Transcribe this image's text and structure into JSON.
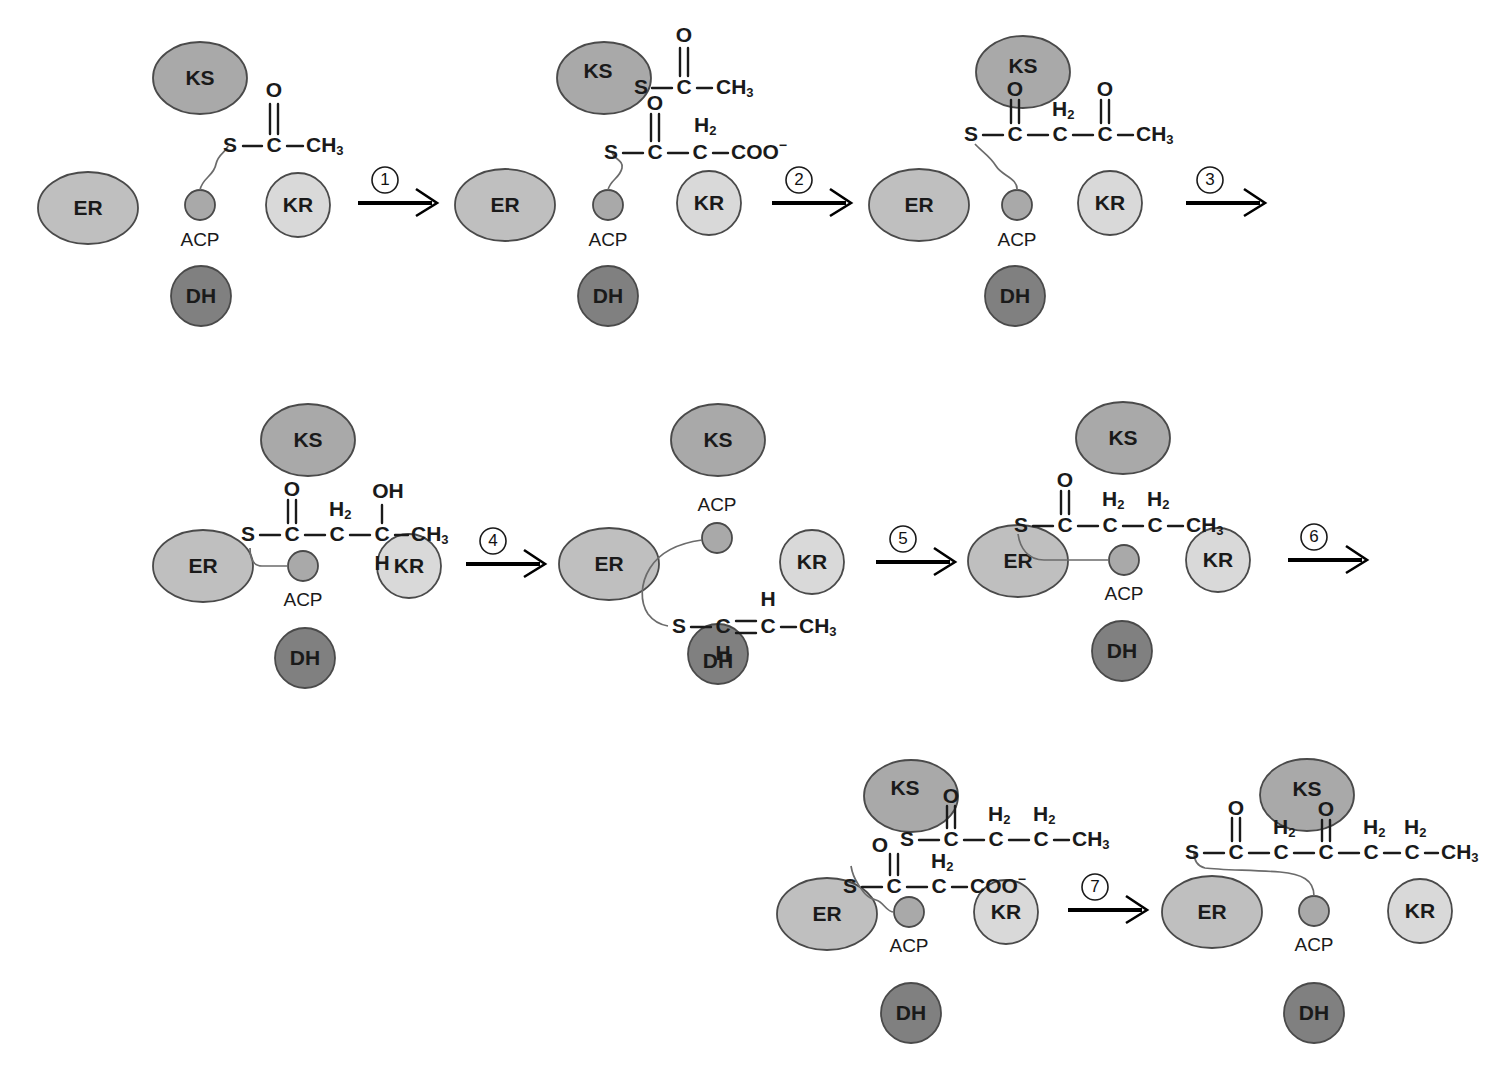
{
  "figure": {
    "type": "reaction-scheme-diagram",
    "panel_count": 8,
    "step_count": 7
  },
  "colors": {
    "background": "#ffffff",
    "ks_fill": "#a9a9a9",
    "er_fill": "#bfbfbf",
    "kr_fill": "#d9d9d9",
    "dh_fill": "#808080",
    "acp_fill": "#a9a9a9",
    "outline": "#4a4a4a",
    "text": "#1a1a1a",
    "arrow": "#000000"
  },
  "domains": {
    "ks": "KS",
    "er": "ER",
    "kr": "KR",
    "dh": "DH",
    "acp": "ACP"
  },
  "atoms": {
    "S": "S",
    "C": "C",
    "O": "O",
    "H": "H",
    "CH3": "CH",
    "CH3_sub": "3",
    "H2_main": "H",
    "H2_sub": "2",
    "OH": "OH",
    "COO": "COO",
    "COO_sup": "−"
  },
  "steps": [
    {
      "id": 1,
      "label": "1"
    },
    {
      "id": 2,
      "label": "2"
    },
    {
      "id": 3,
      "label": "3"
    },
    {
      "id": 4,
      "label": "4"
    },
    {
      "id": 5,
      "label": "5"
    },
    {
      "id": 6,
      "label": "6"
    },
    {
      "id": 7,
      "label": "7"
    }
  ],
  "panels": [
    {
      "index": 1,
      "name": "acetyl-acp",
      "row": 1,
      "molecule": "S-C(=O)-CH3 on ACP",
      "chain_labels": [
        "S",
        "C",
        "CH3"
      ],
      "substituents": [
        "O (double bond on C)"
      ],
      "domains_shown": [
        "KS",
        "ER",
        "KR",
        "DH",
        "ACP"
      ]
    },
    {
      "index": 2,
      "name": "acetyl-ks-malonyl-acp",
      "row": 1,
      "molecule": "KS-S-C(=O)-CH3 and ACP-S-C(=O)-CH2-COO-",
      "chain_labels": [
        "S",
        "C",
        "CH3",
        "S",
        "C",
        "C",
        "COO"
      ],
      "substituents": [
        "O",
        "O",
        "H2"
      ],
      "domains_shown": [
        "KS",
        "ER",
        "KR",
        "DH",
        "ACP"
      ]
    },
    {
      "index": 3,
      "name": "acetoacetyl-acp",
      "row": 1,
      "molecule": "S-C(=O)-CH2-C(=O)-CH3 on ACP",
      "chain_labels": [
        "S",
        "C",
        "C",
        "C",
        "CH3"
      ],
      "substituents": [
        "O",
        "H2",
        "O"
      ],
      "domains_shown": [
        "KS",
        "ER",
        "KR",
        "DH",
        "ACP"
      ]
    },
    {
      "index": 4,
      "name": "hydroxybutyryl-acp",
      "row": 2,
      "molecule": "S-C(=O)-CH2-CH(OH)-CH3 on ACP",
      "chain_labels": [
        "S",
        "C",
        "C",
        "C",
        "CH3"
      ],
      "substituents": [
        "O",
        "H2",
        "OH",
        "H"
      ],
      "domains_shown": [
        "KS",
        "ER",
        "KR",
        "DH",
        "ACP"
      ]
    },
    {
      "index": 5,
      "name": "crotonyl-acp",
      "row": 2,
      "molecule": "S-CH=CH-CH3 on ACP",
      "chain_labels": [
        "S",
        "C",
        "C",
        "CH3"
      ],
      "substituents": [
        "H",
        "H"
      ],
      "domains_shown": [
        "KS",
        "ER",
        "KR",
        "DH",
        "ACP"
      ]
    },
    {
      "index": 6,
      "name": "butyryl-acp",
      "row": 2,
      "molecule": "S-C(=O)-CH2-CH2-CH3 on ACP",
      "chain_labels": [
        "S",
        "C",
        "C",
        "C",
        "CH3"
      ],
      "substituents": [
        "O",
        "H2",
        "H2"
      ],
      "domains_shown": [
        "KS",
        "ER",
        "KR",
        "DH",
        "ACP"
      ]
    },
    {
      "index": 7,
      "name": "butyryl-ks-malonyl-acp",
      "row": 3,
      "molecule": "KS-S-C(=O)-CH2-CH2-CH3 and ACP-S-C(=O)-CH2-COO-",
      "chain_labels": [
        "S",
        "C",
        "C",
        "C",
        "CH3",
        "S",
        "C",
        "C",
        "COO"
      ],
      "substituents": [
        "O",
        "H2",
        "H2",
        "O",
        "H2"
      ],
      "domains_shown": [
        "KS",
        "ER",
        "KR",
        "DH",
        "ACP"
      ]
    },
    {
      "index": 8,
      "name": "ketohexanoyl-acp",
      "row": 3,
      "molecule": "S-C(=O)-CH2-C(=O)-CH2-CH2-CH3 on ACP",
      "chain_labels": [
        "S",
        "C",
        "C",
        "C",
        "C",
        "C",
        "CH3"
      ],
      "substituents": [
        "O",
        "H2",
        "O",
        "H2",
        "H2"
      ],
      "domains_shown": [
        "KS",
        "ER",
        "KR",
        "DH",
        "ACP"
      ]
    }
  ]
}
